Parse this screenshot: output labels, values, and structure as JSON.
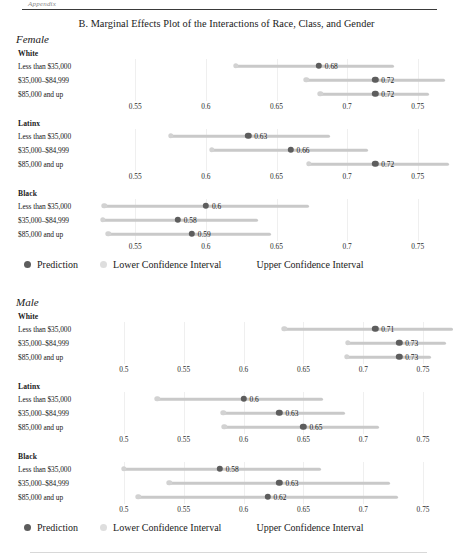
{
  "page": {
    "running_head": "Appendix",
    "figure_title": "B. Marginal Effects Plot of the Interactions of Race, Class, and Gender"
  },
  "legend": {
    "prediction": "Prediction",
    "lower_ci": "Lower Confidence Interval",
    "upper_ci": "Upper Confidence Interval"
  },
  "row_labels": {
    "low": "Less than $35,000",
    "mid": "$35,000–$84,999",
    "high": "$85,000 and up"
  },
  "sections": [
    {
      "label": "Female"
    },
    {
      "label": "Male"
    }
  ],
  "race_labels": {
    "white": "White",
    "latinx": "Latinx",
    "black": "Black"
  },
  "chart_data": {
    "type": "scatter",
    "title": "B. Marginal Effects Plot of the Interactions of Race, Class, and Gender",
    "xlabel": "",
    "ylabel": "",
    "grid": true,
    "legend_position": "bottom",
    "legend_entries": [
      "Prediction",
      "Lower Confidence Interval",
      "Upper Confidence Interval"
    ],
    "panels": [
      {
        "gender": "Female",
        "race": "White",
        "xlim": [
          0.525,
          0.775
        ],
        "xticks": [
          0.55,
          0.6,
          0.65,
          0.7,
          0.75
        ],
        "ticklabels": [
          "0.55",
          "0.6",
          "0.65",
          "0.7",
          "0.75"
        ],
        "rows": [
          {
            "category": "Less than $35,000",
            "prediction": 0.68,
            "label": "0.68",
            "lower": 0.621,
            "upper": 0.733
          },
          {
            "category": "$35,000–$84,999",
            "prediction": 0.72,
            "label": "0.72",
            "lower": 0.671,
            "upper": 0.769
          },
          {
            "category": "$85,000 and up",
            "prediction": 0.72,
            "label": "0.72",
            "lower": 0.681,
            "upper": 0.758
          }
        ]
      },
      {
        "gender": "Female",
        "race": "Latinx",
        "xlim": [
          0.525,
          0.775
        ],
        "xticks": [
          0.55,
          0.6,
          0.65,
          0.7,
          0.75
        ],
        "ticklabels": [
          "0.55",
          "0.6",
          "0.65",
          "0.7",
          "0.75"
        ],
        "rows": [
          {
            "category": "Less than $35,000",
            "prediction": 0.63,
            "label": "0.63",
            "lower": 0.575,
            "upper": 0.688
          },
          {
            "category": "$35,000–$84,999",
            "prediction": 0.66,
            "label": "0.66",
            "lower": 0.604,
            "upper": 0.715
          },
          {
            "category": "$85,000 and up",
            "prediction": 0.72,
            "label": "0.72",
            "lower": 0.673,
            "upper": 0.772
          }
        ]
      },
      {
        "gender": "Female",
        "race": "Black",
        "xlim": [
          0.525,
          0.775
        ],
        "xticks": [
          0.55,
          0.6,
          0.65,
          0.7,
          0.75
        ],
        "ticklabels": [
          "0.55",
          "0.6",
          "0.65",
          "0.7",
          "0.75"
        ],
        "rows": [
          {
            "category": "Less than $35,000",
            "prediction": 0.6,
            "label": "0.6",
            "lower": 0.528,
            "upper": 0.673
          },
          {
            "category": "$35,000–$84,999",
            "prediction": 0.58,
            "label": "0.58",
            "lower": 0.527,
            "upper": 0.637
          },
          {
            "category": "$85,000 and up",
            "prediction": 0.59,
            "label": "0.59",
            "lower": 0.531,
            "upper": 0.646
          }
        ]
      },
      {
        "gender": "Male",
        "race": "White",
        "xlim": [
          0.48,
          0.775
        ],
        "xticks": [
          0.5,
          0.55,
          0.6,
          0.65,
          0.7,
          0.75
        ],
        "ticklabels": [
          "0.5",
          "0.55",
          "0.6",
          "0.65",
          "0.7",
          "0.75"
        ],
        "rows": [
          {
            "category": "Less than $35,000",
            "prediction": 0.71,
            "label": "0.71",
            "lower": 0.634,
            "upper": 0.775
          },
          {
            "category": "$35,000–$84,999",
            "prediction": 0.73,
            "label": "0.73",
            "lower": 0.687,
            "upper": 0.769
          },
          {
            "category": "$85,000 and up",
            "prediction": 0.73,
            "label": "0.73",
            "lower": 0.686,
            "upper": 0.757
          }
        ]
      },
      {
        "gender": "Male",
        "race": "Latinx",
        "xlim": [
          0.48,
          0.775
        ],
        "xticks": [
          0.5,
          0.55,
          0.6,
          0.65,
          0.7,
          0.75
        ],
        "ticklabels": [
          "0.5",
          "0.55",
          "0.6",
          "0.65",
          "0.7",
          "0.75"
        ],
        "rows": [
          {
            "category": "Less than $35,000",
            "prediction": 0.6,
            "label": "0.6",
            "lower": 0.528,
            "upper": 0.666
          },
          {
            "category": "$35,000–$84,999",
            "prediction": 0.63,
            "label": "0.63",
            "lower": 0.583,
            "upper": 0.685
          },
          {
            "category": "$85,000 and up",
            "prediction": 0.65,
            "label": "0.65",
            "lower": 0.584,
            "upper": 0.713
          }
        ]
      },
      {
        "gender": "Male",
        "race": "Black",
        "xlim": [
          0.48,
          0.775
        ],
        "xticks": [
          0.5,
          0.55,
          0.6,
          0.65,
          0.7,
          0.75
        ],
        "ticklabels": [
          "0.5",
          "0.55",
          "0.6",
          "0.65",
          "0.7",
          "0.75"
        ],
        "rows": [
          {
            "category": "Less than $35,000",
            "prediction": 0.58,
            "label": "0.58",
            "lower": 0.5,
            "upper": 0.665
          },
          {
            "category": "$35,000–$84,999",
            "prediction": 0.63,
            "label": "0.63",
            "lower": 0.538,
            "upper": 0.722
          },
          {
            "category": "$85,000 and up",
            "prediction": 0.62,
            "label": "0.62",
            "lower": 0.512,
            "upper": 0.729
          }
        ]
      }
    ]
  }
}
